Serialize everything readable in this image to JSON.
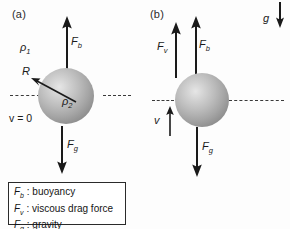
{
  "figure": {
    "background_color": "#fdfdfd",
    "ink_color": "#1a1a1a",
    "sphere_color_light": "#e6e6e6",
    "sphere_color_dark": "#7d7d7d"
  },
  "panel_a": {
    "label": "(a)",
    "density_outer": "ρ",
    "density_outer_sub": "1",
    "density_inner": "ρ",
    "density_inner_sub": "2",
    "radius_label": "R",
    "velocity_label": "v = 0",
    "force_buoyancy": "F",
    "force_buoyancy_sub": "b",
    "force_gravity": "F",
    "force_gravity_sub": "g"
  },
  "panel_b": {
    "label": "(b)",
    "force_viscous": "F",
    "force_viscous_sub": "v",
    "force_buoyancy": "F",
    "force_buoyancy_sub": "b",
    "force_gravity": "F",
    "force_gravity_sub": "g",
    "velocity_label": "v",
    "gravity_label": "g"
  },
  "legend": {
    "rows": [
      {
        "symbol": "F",
        "sub": "b",
        "separator": " : ",
        "description": "buoyancy"
      },
      {
        "symbol": "F",
        "sub": "v",
        "separator": " : ",
        "description": "viscous drag force"
      },
      {
        "symbol": "F",
        "sub": "g",
        "separator": " : ",
        "description": "gravity"
      }
    ]
  }
}
